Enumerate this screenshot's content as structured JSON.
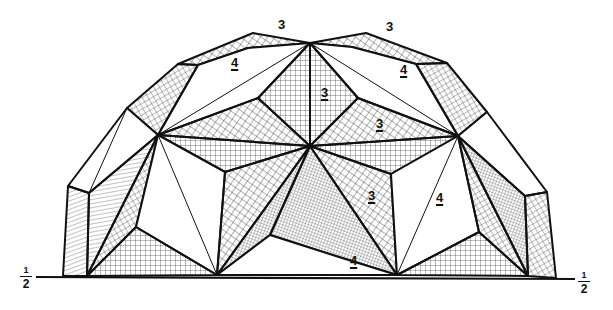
{
  "figure": {
    "face_labels": [
      {
        "text": "3",
        "underlined": false,
        "x": 280,
        "y": 23
      },
      {
        "text": "3",
        "underlined": false,
        "x": 388,
        "y": 25
      },
      {
        "text": "4",
        "underlined": true,
        "x": 232,
        "y": 60
      },
      {
        "text": "4",
        "underlined": true,
        "x": 400,
        "y": 67
      },
      {
        "text": "3",
        "underlined": true,
        "x": 322,
        "y": 91
      },
      {
        "text": "3",
        "underlined": true,
        "x": 376,
        "y": 121
      },
      {
        "text": "3",
        "underlined": true,
        "x": 369,
        "y": 193
      },
      {
        "text": "4",
        "underlined": true,
        "x": 437,
        "y": 195
      },
      {
        "text": "4",
        "underlined": true,
        "x": 351,
        "y": 259
      }
    ],
    "ground_marks": {
      "left": {
        "numerator": "1",
        "denominator": "2"
      },
      "right": {
        "numerator": "1",
        "denominator": "2"
      }
    },
    "colors": {
      "ink": "#111111",
      "paper": "#ffffff"
    }
  }
}
